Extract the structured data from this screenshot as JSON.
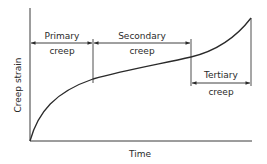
{
  "diagram": {
    "axes": {
      "x_label": "Time",
      "y_label": "Creep strain"
    },
    "stages": [
      {
        "name": "primary",
        "line1": "Primary",
        "line2": "creep"
      },
      {
        "name": "secondary",
        "line1": "Secondary",
        "line2": "creep"
      },
      {
        "name": "tertiary",
        "line1": "Tertiary",
        "line2": "creep"
      }
    ],
    "colors": {
      "line": "#2a2a2a",
      "axis": "#3a3a3a",
      "background": "#ffffff"
    }
  }
}
